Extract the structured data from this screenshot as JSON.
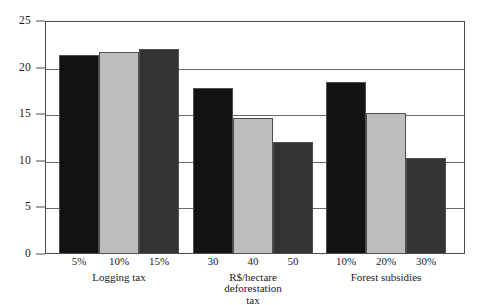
{
  "chart_data": {
    "type": "bar",
    "title": "",
    "subtitle": "",
    "xlabel": "",
    "ylabel": "",
    "ylim": [
      0,
      25
    ],
    "yticks": [
      0,
      5,
      10,
      15,
      20,
      25
    ],
    "ytick_labels": [
      "0",
      "5",
      "10",
      "15",
      "20",
      "25"
    ],
    "grid": true,
    "gridlines_at": [
      5,
      10,
      15,
      20
    ],
    "legend": "none",
    "categories": [
      "5%",
      "10%",
      "15%",
      "30",
      "40",
      "50",
      "10%",
      "20%",
      "30%"
    ],
    "values": [
      21.3,
      21.7,
      22.0,
      17.8,
      14.6,
      12.0,
      18.5,
      15.1,
      10.3
    ],
    "groups": [
      {
        "label_lines": [
          "Logging tax"
        ],
        "categories": [
          "5%",
          "10%",
          "15%"
        ],
        "values": [
          21.3,
          21.7,
          22.0
        ]
      },
      {
        "label_lines": [
          "R$/hectare",
          "deforestation",
          "tax"
        ],
        "categories": [
          "30",
          "40",
          "50"
        ],
        "values": [
          17.8,
          14.6,
          12.0
        ]
      },
      {
        "label_lines": [
          "Forest subsidies"
        ],
        "categories": [
          "10%",
          "20%",
          "30%"
        ],
        "values": [
          18.5,
          15.1,
          10.3
        ]
      }
    ],
    "series_colors": [
      "#121212",
      "#bdbdbd",
      "#333333"
    ],
    "bar_border_color": "#4f4f4f",
    "axis_color": "#4a4a4a",
    "gridline_color": "#6a6a6a",
    "background": "#ffffff"
  }
}
